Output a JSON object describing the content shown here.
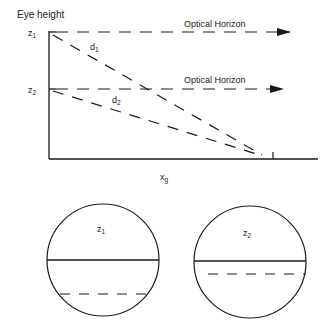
{
  "diagram": {
    "y_axis_title": "Eye height",
    "x_axis_label": {
      "main": "x",
      "sub": "g"
    },
    "heights": [
      {
        "main": "z",
        "sub": "1"
      },
      {
        "main": "z",
        "sub": "2"
      }
    ],
    "horizon_labels": [
      "Optical Horizon",
      "Optical Horizon"
    ],
    "sight_lines": [
      {
        "main": "d",
        "sub": "1"
      },
      {
        "main": "d",
        "sub": "2"
      }
    ],
    "views": [
      {
        "main": "z",
        "sub": "1",
        "horizon": "solid",
        "ground_point": "dashed (far below horizon)"
      },
      {
        "main": "z",
        "sub": "2",
        "horizon": "solid",
        "ground_point": "dashed (near horizon)"
      }
    ],
    "colors": {
      "ink": "#1a1a1a",
      "background": "#ffffff"
    }
  }
}
